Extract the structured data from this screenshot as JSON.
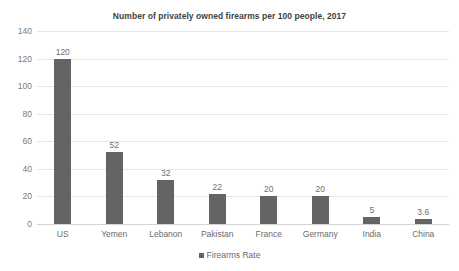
{
  "chart_data": {
    "type": "bar",
    "title": "Number of privately owned firearms per 100 people, 2017",
    "xlabel": "",
    "ylabel": "",
    "categories": [
      "US",
      "Yemen",
      "Lebanon",
      "Pakistan",
      "France",
      "Germany",
      "India",
      "China"
    ],
    "values": [
      120,
      52,
      32,
      22,
      20,
      20,
      5,
      3.6
    ],
    "value_labels": [
      "120",
      "52",
      "32",
      "22",
      "20",
      "20",
      "5",
      "3.6"
    ],
    "series": [
      {
        "name": "Firearms Rate",
        "values": [
          120,
          52,
          32,
          22,
          20,
          20,
          5,
          3.6
        ]
      }
    ],
    "ylim": [
      0,
      140
    ],
    "yticks": [
      0,
      20,
      40,
      60,
      80,
      100,
      120,
      140
    ],
    "ytick_labels": [
      "0",
      "20",
      "40",
      "60",
      "80",
      "100",
      "120",
      "140"
    ],
    "grid": true,
    "legend": {
      "position": "bottom",
      "entries": [
        {
          "label": "Firearms Rate",
          "color": "#646464",
          "marker": "square"
        }
      ]
    },
    "colors": {
      "bar": "#646464",
      "gridline": "#e6e6e6",
      "baseline": "#d4d4d4",
      "background": "#ffffff",
      "title_text": "#3f3f3f",
      "tick_text": "#6b6b6b",
      "value_label_text": "#6e6e6e"
    }
  }
}
